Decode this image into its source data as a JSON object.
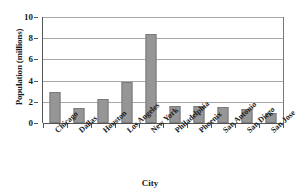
{
  "chart_data": {
    "type": "bar",
    "title": "",
    "xlabel": "City",
    "ylabel": "Population (millions)",
    "categories": [
      "Chicago",
      "Dallas",
      "Houston",
      "Los Angeles",
      "New York",
      "Philadelphia",
      "Phoenix",
      "San Antonio",
      "San Diego",
      "San Jose"
    ],
    "values": [
      2.9,
      1.45,
      2.25,
      3.9,
      8.4,
      1.6,
      1.6,
      1.5,
      1.35,
      0.95
    ],
    "ylim": [
      0,
      10
    ],
    "yticks": [
      0,
      2,
      4,
      6,
      8,
      10
    ],
    "ytick_labels": [
      "0",
      "2",
      "4",
      "6",
      "8",
      "10"
    ],
    "grid": true,
    "legend": "none",
    "bar_color": "#969696",
    "bar_edge_color": "#7a7a7a",
    "gridline_color": "#a8a8a8",
    "axis_color": "#555555"
  }
}
